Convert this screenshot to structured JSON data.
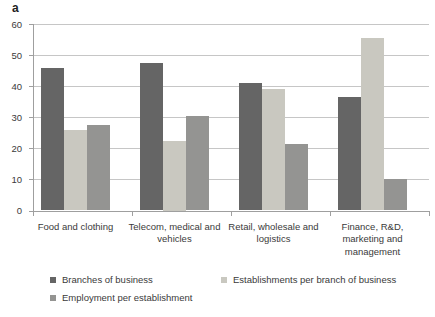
{
  "panel_label": "a",
  "chart_data": {
    "type": "bar",
    "title": "",
    "xlabel": "",
    "ylabel": "",
    "categories": [
      "Food and clothing",
      "Telecom, medical and vehicles",
      "Retail, wholesale and logistics",
      "Finance, R&D, marketing and management"
    ],
    "series": [
      {
        "name": "Branches of business",
        "color": "#656565",
        "values": [
          46,
          47.5,
          41,
          36.5
        ]
      },
      {
        "name": "Establishments per branch of business",
        "color": "#c9c8c0",
        "values": [
          26,
          22.5,
          39,
          55.5
        ]
      },
      {
        "name": "Employment per establishment",
        "color": "#949492",
        "values": [
          27.5,
          30.5,
          21.5,
          10
        ]
      }
    ],
    "ylim": [
      0,
      60
    ],
    "yticks": [
      0,
      10,
      20,
      30,
      40,
      50,
      60
    ],
    "grid": true,
    "legend_position": "bottom-left, two rows"
  },
  "colors": {
    "gridline": "#c6c6c6",
    "axis": "#9f9f9f",
    "text": "#3a3a3a"
  }
}
